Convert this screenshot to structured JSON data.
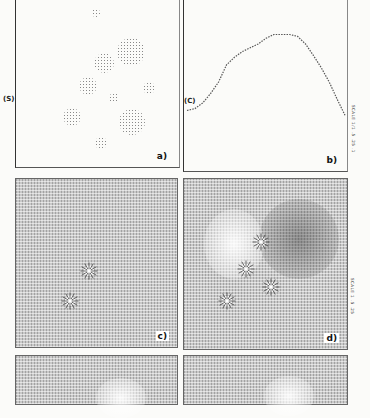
{
  "figure": {
    "panels": [
      {
        "id": "a",
        "label": "a)",
        "side_label": "(S)",
        "type": "point-source distribution",
        "blobs": [
          {
            "x": 80,
            "y": 13,
            "r": 4
          },
          {
            "x": 115,
            "y": 52,
            "r": 14
          },
          {
            "x": 88,
            "y": 63,
            "r": 10
          },
          {
            "x": 72,
            "y": 86,
            "r": 9
          },
          {
            "x": 133,
            "y": 88,
            "r": 6
          },
          {
            "x": 98,
            "y": 98,
            "r": 5
          },
          {
            "x": 56,
            "y": 117,
            "r": 9
          },
          {
            "x": 116,
            "y": 122,
            "r": 13
          },
          {
            "x": 85,
            "y": 143,
            "r": 6
          }
        ]
      },
      {
        "id": "b",
        "label": "b)",
        "side_label": "(C)",
        "type": "line profile",
        "scale_text": "SCALE 1/1 .5 .25 .1"
      },
      {
        "id": "c",
        "label": "c)",
        "type": "vector field",
        "sources": [
          {
            "x": 73,
            "y": 92
          },
          {
            "x": 54,
            "y": 122
          }
        ]
      },
      {
        "id": "d",
        "label": "d)",
        "type": "vector field",
        "sources": [
          {
            "x": 77,
            "y": 63
          },
          {
            "x": 62,
            "y": 90
          },
          {
            "x": 87,
            "y": 108
          },
          {
            "x": 43,
            "y": 122
          }
        ],
        "scale_text": "SCALE 1 .5 .25"
      },
      {
        "id": "e",
        "label": "",
        "type": "vector field (partial)"
      },
      {
        "id": "f",
        "label": "",
        "type": "vector field (partial)"
      }
    ]
  },
  "chart_data": {
    "type": "line",
    "title": "",
    "panel": "b)",
    "xlabel": "",
    "ylabel": "(C)",
    "x": [
      0,
      5,
      10,
      15,
      20,
      25,
      30,
      35,
      40,
      45,
      50,
      55,
      60,
      65,
      70,
      75,
      80,
      85,
      90,
      95,
      100
    ],
    "values": [
      0.1,
      0.12,
      0.18,
      0.28,
      0.4,
      0.58,
      0.66,
      0.72,
      0.76,
      0.8,
      0.86,
      0.9,
      0.9,
      0.9,
      0.88,
      0.8,
      0.68,
      0.55,
      0.4,
      0.22,
      0.05
    ],
    "ylim": [
      0,
      1
    ],
    "grid": false
  }
}
